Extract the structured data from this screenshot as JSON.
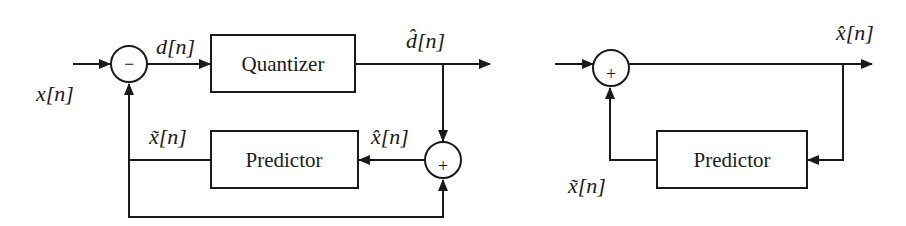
{
  "encoder": {
    "input_label": "x[n]",
    "diff_label": "d[n]",
    "quantized_label": "d̂[n]",
    "reconstructed_label": "x̂[n]",
    "prediction_label": "x̃[n]",
    "quantizer_block": "Quantizer",
    "predictor_block": "Predictor",
    "subtractor_sign": "−",
    "adder_sign": "+"
  },
  "decoder": {
    "output_label": "x̂[n]",
    "prediction_label": "x̃[n]",
    "predictor_block": "Predictor",
    "adder_sign": "+"
  },
  "colors": {
    "stroke": "#1a1a1a",
    "background": "#ffffff"
  }
}
